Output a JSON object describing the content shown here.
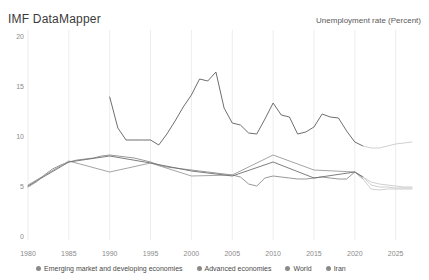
{
  "header": {
    "title": "IMF DataMapper",
    "metric": "Unemployment rate (Percent)"
  },
  "chart_data": {
    "type": "line",
    "title": "Unemployment rate (Percent)",
    "xlabel": "",
    "ylabel": "Percent",
    "xlim": [
      1980,
      2027
    ],
    "ylim": [
      0,
      20
    ],
    "grid": "vertical",
    "legend_position": "bottom",
    "y_ticks": [
      "0",
      "5",
      "10",
      "15",
      "20"
    ],
    "x_ticks": [
      "1980",
      "1985",
      "1990",
      "1995",
      "2000",
      "2005",
      "2010",
      "2015",
      "2020",
      "2025"
    ],
    "projection_starts": 2021,
    "colors": {
      "emerging": "#8c8c8c",
      "advanced": "#9a9a9a",
      "world": "#6f6f6f",
      "iran": "#5e5e5e",
      "projection": "#c9c9c9",
      "gridline": "#ededed",
      "axis_text": "#8a8a8a"
    },
    "series": [
      {
        "name": "Emerging market and developing economies",
        "color": "#8c8c8c",
        "x": [
          1980,
          1981,
          1982,
          1983,
          1984,
          1985,
          1986,
          1987,
          1988,
          1989,
          1990,
          1991,
          1992,
          1993,
          1994,
          1995,
          1996,
          1997,
          1998,
          1999,
          2000,
          2001,
          2002,
          2003,
          2004,
          2005,
          2006,
          2007,
          2008,
          2009,
          2010,
          2011,
          2012,
          2013,
          2014,
          2015,
          2016,
          2017,
          2018,
          2019,
          2020,
          2021,
          2022,
          2023,
          2024,
          2025,
          2026,
          2027
        ],
        "values": [
          5.1,
          5.6,
          6.3,
          6.9,
          7.3,
          7.6,
          7.8,
          7.9,
          8.0,
          8.2,
          8.3,
          8.2,
          8.1,
          8.0,
          7.8,
          7.6,
          7.3,
          7.1,
          7.0,
          6.9,
          6.8,
          6.7,
          6.6,
          6.5,
          6.4,
          6.3,
          6.1,
          5.4,
          5.2,
          6.0,
          6.2,
          6.1,
          6.0,
          5.9,
          5.9,
          6.0,
          6.1,
          6.0,
          5.9,
          5.9,
          6.6,
          6.1,
          5.6,
          5.4,
          5.3,
          5.2,
          5.1,
          5.1
        ]
      },
      {
        "name": "Advanced economies",
        "color": "#9a9a9a",
        "x": [
          1980,
          1985,
          1990,
          1995,
          2000,
          2005,
          2010,
          2015,
          2020,
          2021,
          2022,
          2023,
          2024,
          2025,
          2026,
          2027
        ],
        "values": [
          5.3,
          7.7,
          6.6,
          7.5,
          6.2,
          6.3,
          8.3,
          6.8,
          6.6,
          5.9,
          4.9,
          4.8,
          4.9,
          4.9,
          4.9,
          4.9
        ]
      },
      {
        "name": "World",
        "color": "#6f6f6f",
        "x": [
          1980,
          1985,
          1990,
          1995,
          2000,
          2005,
          2010,
          2015,
          2020,
          2021,
          2022,
          2023,
          2024,
          2025,
          2026,
          2027
        ],
        "values": [
          5.2,
          7.6,
          8.2,
          7.5,
          6.7,
          6.2,
          7.6,
          6.0,
          6.6,
          6.1,
          5.3,
          5.1,
          5.1,
          5.0,
          5.0,
          5.0
        ]
      },
      {
        "name": "Iran",
        "color": "#5e5e5e",
        "x": [
          1990,
          1991,
          1992,
          1993,
          1994,
          1995,
          1996,
          1997,
          1998,
          1999,
          2000,
          2001,
          2002,
          2003,
          2004,
          2005,
          2006,
          2007,
          2008,
          2009,
          2010,
          2011,
          2012,
          2013,
          2014,
          2015,
          2016,
          2017,
          2018,
          2019,
          2020,
          2021,
          2022,
          2023,
          2024,
          2025,
          2026,
          2027
        ],
        "values": [
          14.1,
          11.0,
          9.8,
          9.8,
          9.8,
          9.8,
          9.3,
          10.4,
          11.7,
          13.1,
          14.3,
          15.9,
          15.7,
          16.6,
          13.0,
          11.5,
          11.3,
          10.5,
          10.4,
          11.9,
          13.5,
          12.3,
          12.1,
          10.4,
          10.6,
          11.1,
          12.4,
          12.1,
          12.0,
          10.7,
          9.6,
          9.2,
          9.0,
          9.0,
          9.2,
          9.4,
          9.5,
          9.6
        ]
      }
    ]
  },
  "legend": {
    "items": [
      {
        "label": "Emerging market and developing economies",
        "color": "#8a8a8a"
      },
      {
        "label": "Advanced economies",
        "color": "#8a8a8a"
      },
      {
        "label": "World",
        "color": "#8a8a8a"
      },
      {
        "label": "Iran",
        "color": "#8a8a8a"
      }
    ]
  }
}
